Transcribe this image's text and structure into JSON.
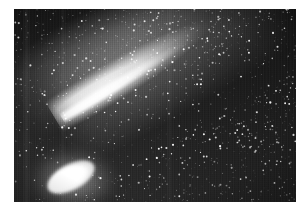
{
  "page": {
    "background_color": "#ffffff",
    "width": 308,
    "height": 216
  },
  "figure": {
    "name": "comet-photograph",
    "media_type": "photograph",
    "rendering": "black-and-white halftone print scan",
    "frame": {
      "x": 14,
      "y": 9,
      "width": 282,
      "height": 193
    },
    "background_color": "#1c1c1c",
    "highlight_color": "#ffffff"
  },
  "comet": {
    "nucleus_label": "comet-nucleus",
    "nucleus_center": {
      "x": 60,
      "y": 177
    },
    "tail_label": "comet-tail",
    "tail_angle_degrees": -31,
    "tail_direction": "lower-left to upper-right",
    "coma_label": "comet-coma"
  },
  "starfield": {
    "label": "star-field",
    "description": "dense scattered white star points over dark sky"
  },
  "caption": {
    "text": ""
  }
}
